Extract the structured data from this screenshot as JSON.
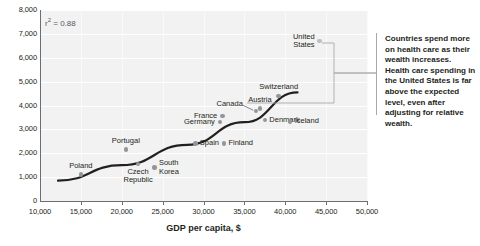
{
  "chart_data": {
    "type": "scatter",
    "title": "",
    "xlabel": "GDP per capita, $",
    "ylabel": "",
    "xlim": [
      10000,
      50000
    ],
    "ylim": [
      0,
      8000
    ],
    "grid": true,
    "legend": "none",
    "xticks": [
      "10,000",
      "15,000",
      "20,000",
      "25,000",
      "30,000",
      "35,000",
      "40,000",
      "45,000",
      "50,000"
    ],
    "xtick_values": [
      10000,
      15000,
      20000,
      25000,
      30000,
      35000,
      40000,
      45000,
      50000
    ],
    "yticks": [
      "0",
      "1,000",
      "2,000",
      "3,000",
      "4,000",
      "5,000",
      "6,000",
      "7,000",
      "8,000"
    ],
    "ytick_values": [
      0,
      1000,
      2000,
      3000,
      4000,
      5000,
      6000,
      7000,
      8000
    ],
    "r_squared_label": "r",
    "r_squared_exp": "2",
    "r_squared_value": "= 0.88",
    "points": [
      {
        "name": "Poland",
        "x": 15000,
        "y": 1100,
        "label_pos": "above-left",
        "highlight": false
      },
      {
        "name": "Portugal",
        "x": 20500,
        "y": 2150,
        "label_pos": "above",
        "highlight": false
      },
      {
        "name": "Czech\nRepublic",
        "x": 22000,
        "y": 1550,
        "label_pos": "below",
        "highlight": false
      },
      {
        "name": "South\nKorea",
        "x": 24000,
        "y": 1400,
        "label_pos": "right",
        "highlight": false
      },
      {
        "name": "Spain",
        "x": 29000,
        "y": 2400,
        "label_pos": "right",
        "highlight": false
      },
      {
        "name": "Finland",
        "x": 32500,
        "y": 2400,
        "label_pos": "right",
        "highlight": false
      },
      {
        "name": "Germany",
        "x": 32000,
        "y": 3300,
        "label_pos": "left",
        "highlight": false
      },
      {
        "name": "France",
        "x": 32300,
        "y": 3560,
        "label_pos": "left",
        "highlight": false
      },
      {
        "name": "Canada",
        "x": 36400,
        "y": 3760,
        "label_pos": "left-arrow",
        "highlight": false
      },
      {
        "name": "Austria",
        "x": 36900,
        "y": 3880,
        "label_pos": "above",
        "highlight": false
      },
      {
        "name": "Denmark",
        "x": 37500,
        "y": 3400,
        "label_pos": "right",
        "highlight": false
      },
      {
        "name": "Switzerland",
        "x": 39200,
        "y": 4400,
        "label_pos": "above",
        "highlight": false
      },
      {
        "name": "Iceland",
        "x": 40600,
        "y": 3320,
        "label_pos": "right",
        "highlight": false
      },
      {
        "name": "United\nStates",
        "x": 44200,
        "y": 6700,
        "label_pos": "left",
        "highlight": true
      }
    ],
    "trendline": {
      "type": "curve",
      "description": "Upward-sloping fitted trend curve",
      "points": [
        {
          "x": 12200,
          "y": 850
        },
        {
          "x": 20000,
          "y": 1500
        },
        {
          "x": 28000,
          "y": 2350
        },
        {
          "x": 35000,
          "y": 3300
        },
        {
          "x": 41500,
          "y": 4550
        }
      ]
    },
    "annotation": {
      "text": "Countries spend more on health care as their wealth increases. Health care spending in the United States is far above the expected level, even after adjusting for relative wealth.",
      "bracket_targets": [
        "United States",
        "trendline-expected"
      ]
    }
  },
  "colors": {
    "plot_background": "#f2f2f2",
    "gridline": "#ffffff",
    "axis": "#6d6e71",
    "point": "#939598",
    "point_highlight": "#bcbec0",
    "trendline": "#231f20",
    "text": "#231f20",
    "bracket": "#a7a9ac"
  }
}
